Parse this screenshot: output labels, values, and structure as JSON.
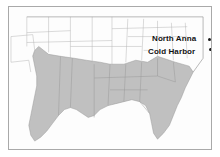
{
  "figure": {
    "name": "map-southeastern-united-states",
    "frame": {
      "border_color": "#a9a9a9",
      "background_color": "#ffffff"
    },
    "colors": {
      "shaded_region_fill": "#c0c0c0",
      "unshaded_region_fill": "#fdfdfd",
      "boundary_line": "#9a9a9a",
      "outline": "#8a8a8a",
      "label_text": "#111111",
      "marker": "#1a1a1a"
    }
  },
  "labels": [
    {
      "id": "north-anna",
      "text": "North Anna",
      "marker": "battle-site-dot"
    },
    {
      "id": "cold-harbor",
      "text": "Cold Harbor",
      "marker": "battle-site-dot"
    }
  ],
  "regions": {
    "shaded": {
      "name": "confederate-states-shaded-area",
      "fill": "#c0c0c0"
    },
    "unshaded": {
      "name": "union-states-unshaded-area",
      "fill": "#fdfdfd"
    }
  }
}
